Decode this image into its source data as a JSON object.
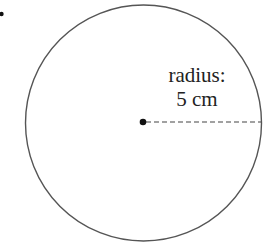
{
  "diagram": {
    "type": "circle-radius",
    "label_line1": "radius:",
    "label_line2": "5 cm",
    "radius_value": 5,
    "radius_unit": "cm",
    "colors": {
      "stroke": "#555555",
      "text": "#222222",
      "dot": "#111111"
    }
  }
}
